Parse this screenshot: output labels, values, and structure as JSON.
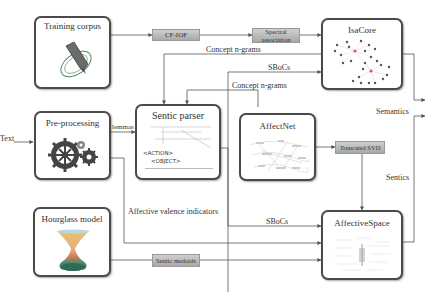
{
  "boxes": {
    "training_corpus": {
      "title": "Training corpus",
      "icon": "pencil-orbit-icon"
    },
    "preprocessing": {
      "title": "Pre-processing",
      "icon": "gears-icon"
    },
    "hourglass_model": {
      "title": "Hourglass model",
      "icon": "hourglass-icon"
    },
    "sentic_parser": {
      "title": "Sentic parser",
      "icon": "parse-tree-icon",
      "tags": [
        "<ACTION>",
        "<OBJECT>"
      ]
    },
    "affectnet": {
      "title": "AffectNet",
      "icon": "semantic-network-icon"
    },
    "isacore": {
      "title": "IsaCore",
      "icon": "cluster-graph-icon"
    },
    "affectivespace": {
      "title": "AffectiveSpace",
      "icon": "vector-space-icon"
    }
  },
  "processes": {
    "cf_iof": "CF-IOF",
    "spectral_association": "Spectral association",
    "truncated_svd": "Truncated SVD",
    "sentic_medoids": "Sentic medoids"
  },
  "edge_labels": {
    "text": "Text",
    "lemmas": "lemmas",
    "concept_ngrams_top": "Concept n-grams",
    "sbocs_top": "SBoCs",
    "concept_ngrams_mid": "Concept n-grams",
    "affective_valence": "Affective valence indicators",
    "sbocs_bottom": "SBoCs",
    "semantics": "Semantics",
    "sentics": "Sentics"
  },
  "colors": {
    "box_border": "#4a4a4a",
    "wire": "#555555",
    "pill_top": "#cfcfcf",
    "pill_bottom": "#a8a8a8",
    "orbit": "#4a8a5a",
    "pencil": "#555555",
    "gear": "#444444",
    "hourglass_top": "#e8c06a",
    "hourglass_mid": "#d07a5a",
    "hourglass_base": "#2f6a55"
  }
}
